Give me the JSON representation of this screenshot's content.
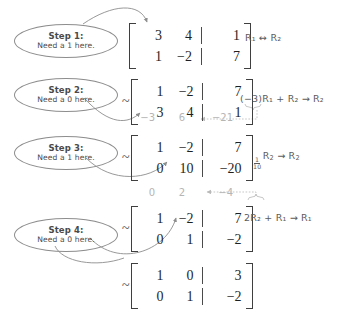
{
  "document": {
    "title": "Row reduction worked example",
    "ink_color": "#3a3a3a",
    "annotation_color": "#b5b5b5"
  },
  "steps": [
    {
      "bubble": {
        "title": "Step 1:",
        "subtitle": "Need a 1 here."
      },
      "prefix": "",
      "matrix": [
        [
          "3",
          "4",
          "1"
        ],
        [
          "1",
          "−2",
          "7"
        ]
      ],
      "operation": {
        "text": "R₁ ↔ R₂",
        "a": "R",
        "a_sub": "1",
        "symbol": "↔",
        "b": "R",
        "b_sub": "2"
      }
    },
    {
      "bubble": {
        "title": "Step 2:",
        "subtitle": "Need a 0 here."
      },
      "prefix": "~",
      "matrix": [
        [
          "1",
          "−2",
          "7"
        ],
        [
          "3",
          "4",
          "1"
        ]
      ],
      "annotation_below": [
        "−3",
        "6",
        "−21"
      ],
      "operation": {
        "text": "(−3)R₁ + R₂ → R₂"
      }
    },
    {
      "bubble": {
        "title": "Step 3:",
        "subtitle": "Need a 1 here."
      },
      "prefix": "~",
      "matrix": [
        [
          "1",
          "−2",
          "7"
        ],
        [
          "0",
          "10",
          "−20"
        ]
      ],
      "operation": {
        "text": "1/10 R₂ → R₂",
        "fraction_num": "1",
        "fraction_den": "10"
      }
    },
    {
      "bubble": {
        "title": "Step 4:",
        "subtitle": "Need a 0 here."
      },
      "prefix": "~",
      "annotation_above": [
        "0",
        "2",
        "−4"
      ],
      "matrix": [
        [
          "1",
          "−2",
          "7"
        ],
        [
          "0",
          "1",
          "−2"
        ]
      ],
      "operation": {
        "text": "2R₂ + R₁ → R₁"
      }
    },
    {
      "bubble": null,
      "prefix": "~",
      "matrix": [
        [
          "1",
          "0",
          "3"
        ],
        [
          "0",
          "1",
          "−2"
        ]
      ],
      "operation": null
    }
  ]
}
